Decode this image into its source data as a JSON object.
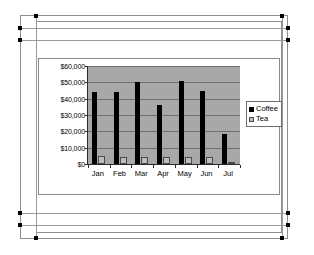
{
  "chart_data": {
    "type": "bar",
    "title": "",
    "subtitle": "",
    "xlabel": "",
    "ylabel": "",
    "categories": [
      "Jan",
      "Feb",
      "Mar",
      "Apr",
      "May",
      "Jun",
      "Jul"
    ],
    "series": [
      {
        "name": "Coffee",
        "color": "#000000",
        "values": [
          44000,
          44000,
          50000,
          36000,
          51000,
          45000,
          18500
        ]
      },
      {
        "name": "Tea",
        "color": "#bdbdbd",
        "values": [
          5000,
          4500,
          4500,
          4500,
          4500,
          4000,
          400
        ]
      }
    ],
    "ylim": [
      0,
      60000
    ],
    "ytick_values": [
      0,
      10000,
      20000,
      30000,
      40000,
      50000,
      60000
    ],
    "ytick_labels": [
      "$0",
      "$10,000",
      "$20,000",
      "$30,000",
      "$40,000",
      "$50,000",
      "$60,000"
    ],
    "grid": true,
    "grid_axis": "y",
    "legend": true,
    "legend_position": "right",
    "plot_background": "#a8a8a8",
    "chart_background": "#ffffff"
  },
  "legend": {
    "entries": [
      {
        "label": "Coffee",
        "swatch_name": "legend-swatch-coffee"
      },
      {
        "label": "Tea",
        "swatch_name": "legend-swatch-tea"
      }
    ]
  },
  "selection": {
    "state": "selected",
    "handle_count": 8
  }
}
